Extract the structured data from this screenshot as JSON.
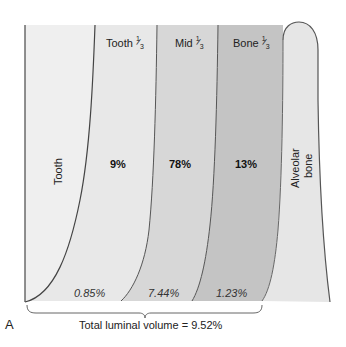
{
  "figure": {
    "panel_letter": "A",
    "regions": [
      {
        "id": "tooth",
        "label": "Tooth",
        "orientation": "vertical",
        "fill": "#eeeeee"
      },
      {
        "id": "tooth-third",
        "label": "Tooth",
        "fraction": {
          "num": "1",
          "den": "3"
        },
        "percent": "9%",
        "luminal_volume": "0.85%",
        "fill": "#e7e7e7"
      },
      {
        "id": "mid-third",
        "label": "Mid",
        "fraction": {
          "num": "1",
          "den": "3"
        },
        "percent": "78%",
        "luminal_volume": "7.44%",
        "fill": "#d6d6d6"
      },
      {
        "id": "bone-third",
        "label": "Bone",
        "fraction": {
          "num": "1",
          "den": "3"
        },
        "percent": "13%",
        "luminal_volume": "1.23%",
        "fill": "#c2c2c2"
      },
      {
        "id": "alveolar-bone",
        "label_line1": "Alveolar",
        "label_line2": "bone",
        "orientation": "vertical",
        "fill": "#e6e6e6"
      }
    ],
    "total_label": "Total luminal volume = 9.52%",
    "colors": {
      "outline": "#555555",
      "background": "#ffffff",
      "bracket": "#666666"
    }
  }
}
